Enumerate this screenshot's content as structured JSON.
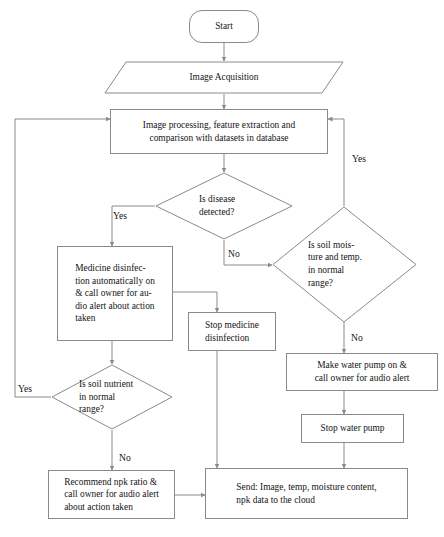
{
  "diagram": {
    "line_color": "#8a8a8a",
    "text_color": "#151515",
    "background": "#ffffff"
  },
  "nodes": {
    "start": {
      "label": "Start",
      "shape": "terminal"
    },
    "image_acquisition": {
      "label": "Image Acquisition",
      "shape": "input-output"
    },
    "image_processing": {
      "label": "Image processing, feature extraction and\ncomparison with datasets in database",
      "shape": "process"
    },
    "disease_decision": {
      "label": "Is disease\ndetected?",
      "shape": "decision"
    },
    "medicine_disinfection": {
      "label": "Medicine  disinfec-\ntion automatically on\n& call owner for au-\ndio alert about action\ntaken",
      "shape": "process"
    },
    "stop_medicine": {
      "label": "Stop  medicine\ndisinfection",
      "shape": "process"
    },
    "soil_moisture_decision": {
      "label": "Is soil mois-\nture and temp.\nin normal\nrange?",
      "shape": "decision"
    },
    "water_pump_on": {
      "label": "Make water pump on &\ncall owner for audio alert",
      "shape": "process"
    },
    "stop_water_pump": {
      "label": "Stop water pump",
      "shape": "process"
    },
    "soil_nutrient_decision": {
      "label": "Is soil nutrient\nin        normal\nrange?",
      "shape": "decision"
    },
    "recommend_npk": {
      "label": "Recommend npk ratio &\ncall owner for audio alert\nabout action taken",
      "shape": "process"
    },
    "send_cloud": {
      "label": "Send: Image, temp, moisture content,\nnpk data to the cloud",
      "shape": "process"
    }
  },
  "edge_labels": {
    "disease_yes": "Yes",
    "disease_no": "No",
    "moisture_yes": "Yes",
    "moisture_no": "No",
    "nutrient_yes": "Yes",
    "nutrient_no": "No"
  }
}
